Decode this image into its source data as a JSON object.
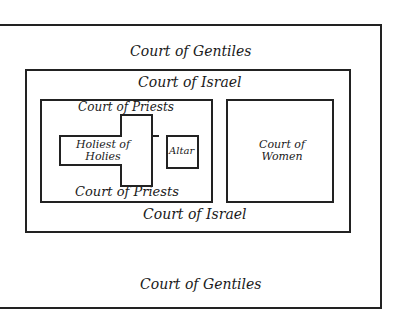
{
  "diagram": {
    "courts": {
      "gentiles_top": "Court of Gentiles",
      "gentiles_bottom": "Court of Gentiles",
      "israel_top": "Court of Israel",
      "israel_bottom": "Court of Israel",
      "priests_top": "Court of Priests",
      "priests_bottom": "Court of Priests",
      "women_line1": "Court of",
      "women_line2": "Women"
    },
    "sanctuary": {
      "line1": "Holiest of",
      "line2": "Holies"
    },
    "altar": "Altar",
    "colors": {
      "line": "#222222",
      "background": "#ffffff"
    }
  }
}
